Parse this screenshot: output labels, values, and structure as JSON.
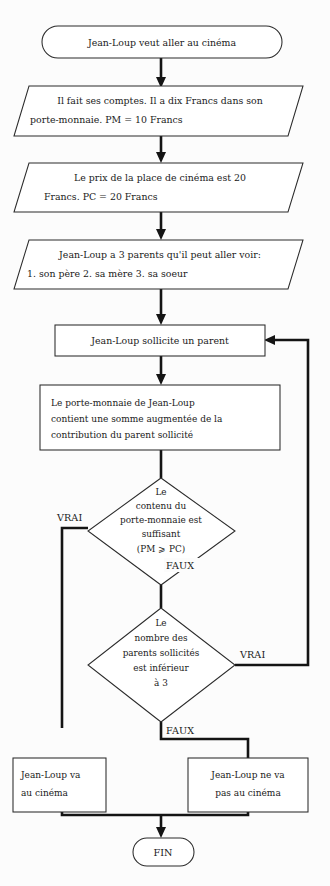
{
  "diagram": {
    "language": "fr",
    "colors": {
      "background": "#fcfcfc",
      "shape_fill": "#ffffff",
      "shape_stroke": "#2b2b2b",
      "connector": "#141414",
      "text": "#1a1a1a"
    }
  },
  "nodes": {
    "start": {
      "type": "terminal",
      "shape": "stadium",
      "text": "Jean-Loup veut aller au cinéma"
    },
    "io_1": {
      "type": "input-output",
      "shape": "parallelogram",
      "line1": "Il fait ses comptes. Il a dix Francs dans son",
      "line2": "porte-monnaie. PM = 10 Francs"
    },
    "io_2": {
      "type": "input-output",
      "shape": "parallelogram",
      "line1": "Le prix de la place de cinéma est 20",
      "line2": "Francs. PC = 20 Francs"
    },
    "io_3": {
      "type": "input-output",
      "shape": "parallelogram",
      "line1": "Jean-Loup a 3 parents qu'il peut aller voir:",
      "line2": "1. son père  2. sa mère  3. sa soeur"
    },
    "process_1": {
      "type": "process",
      "shape": "rectangle",
      "text": "Jean-Loup sollicite un parent"
    },
    "process_2": {
      "type": "process",
      "shape": "rectangle",
      "line1": "Le porte-monnaie de Jean-Loup",
      "line2": "contient une somme augmentée de la",
      "line3": "contribution du parent sollicité"
    },
    "decision_1": {
      "type": "decision",
      "shape": "diamond",
      "line1": "Le",
      "line2": "contenu du",
      "line3": "porte-monnaie est",
      "line4": "suffisant",
      "line5": "(PM ⩾ PC)"
    },
    "decision_2": {
      "type": "decision",
      "shape": "diamond",
      "line1": "Le",
      "line2": "nombre des",
      "line3": "parents sollicités",
      "line4": "est inférieur",
      "line5": "à 3"
    },
    "outcome_yes": {
      "type": "process",
      "shape": "rectangle",
      "line1": "Jean-Loup va",
      "line2": "au cinéma"
    },
    "outcome_no": {
      "type": "process",
      "shape": "rectangle",
      "line1": "Jean-Loup ne va",
      "line2": "pas au cinéma"
    },
    "end": {
      "type": "terminal",
      "shape": "stadium",
      "text": "FIN"
    }
  },
  "edge_labels": {
    "decision_1_true": "VRAI",
    "decision_1_false": "FAUX",
    "decision_2_true": "VRAI",
    "decision_2_false": "FAUX"
  }
}
